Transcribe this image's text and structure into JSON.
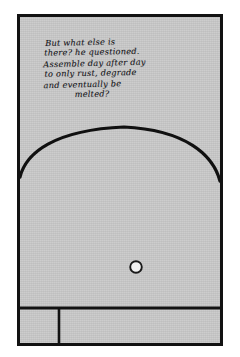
{
  "page": {
    "background_color": "#ffffff"
  },
  "panel": {
    "name": "comic-panel",
    "fill_color": "#c9c9c9",
    "border_color": "#121212",
    "border_width_px": 3
  },
  "caption": {
    "full_text": "But what else is there? he questioned. Assemble day after day to only rust, degrade and eventually be melted?",
    "lines": [
      "But what else is",
      "there? he questioned.",
      "Assemble day after day",
      "to only rust, degrade",
      "and eventually be",
      "melted?"
    ],
    "ink_color": "#17171c",
    "style": "handwritten-cursive"
  },
  "scene": {
    "arch": {
      "name": "arch-dome-outline",
      "description": "large dome/arch outline spanning the panel width",
      "stroke_color": "#101010",
      "apex_y_px": 123,
      "left_spring_y_px": 172,
      "right_spring_y_px": 175
    },
    "porthole": {
      "name": "porthole-circle",
      "description": "small white circle with dark outline",
      "center_x_px": 136,
      "center_y_px": 267,
      "radius_px": 6,
      "fill_color": "#f2f2f2",
      "stroke_color": "#1a1a1a"
    },
    "floor_divider": {
      "name": "floor-horizontal-divider",
      "y_px": 308,
      "stroke_color": "#121212"
    },
    "vertical_divider": {
      "name": "floor-vertical-divider",
      "x_px": 57,
      "y_start_px": 311,
      "y_end_px": 343,
      "stroke_color": "#121212"
    }
  }
}
